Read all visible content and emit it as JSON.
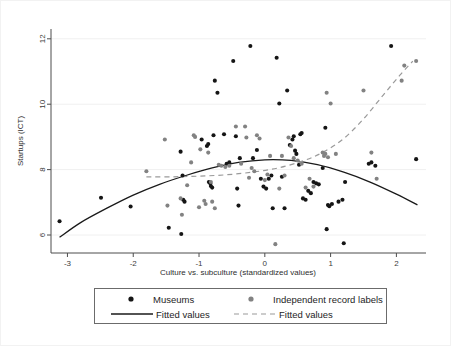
{
  "figure": {
    "background_color": "#ffffff",
    "plot_area": {
      "left": 50,
      "right": 425,
      "top": 28,
      "bottom": 252
    }
  },
  "chart_data": {
    "type": "scatter",
    "title": "",
    "xlabel": "Culture vs. subculture (standardized values)",
    "ylabel": "Startups (ICT)",
    "xlim": [
      -3.25,
      2.45
    ],
    "ylim": [
      5.45,
      12.3
    ],
    "xticks": [
      -3,
      -2,
      -1,
      0,
      1,
      2
    ],
    "xticklabels": [
      "-3",
      "-2",
      "-1",
      "0",
      "1",
      "2"
    ],
    "yticks": [
      6,
      8,
      10,
      12
    ],
    "yticklabels": [
      "6",
      "8",
      "10",
      "12"
    ],
    "grid": "horizontal-faint",
    "legend_position": "below-axes",
    "series": [
      {
        "name": "Museums",
        "marker": "circle",
        "color": "#151515",
        "size": 4.1,
        "points": [
          [
            -3.12,
            6.42
          ],
          [
            -2.49,
            7.14
          ],
          [
            -2.04,
            6.87
          ],
          [
            -1.46,
            6.22
          ],
          [
            -1.27,
            6.03
          ],
          [
            -1.25,
            7.82
          ],
          [
            -1.28,
            8.55
          ],
          [
            -1.24,
            7.08
          ],
          [
            -1.22,
            7.02
          ],
          [
            -0.96,
            8.92
          ],
          [
            -0.88,
            8.72
          ],
          [
            -0.86,
            8.78
          ],
          [
            -0.85,
            7.62
          ],
          [
            -0.83,
            7.58
          ],
          [
            -0.82,
            7.5
          ],
          [
            -0.8,
            7.45
          ],
          [
            -0.78,
            9.05
          ],
          [
            -0.72,
            10.35
          ],
          [
            -0.76,
            10.72
          ],
          [
            -0.62,
            9.08
          ],
          [
            -0.58,
            8.18
          ],
          [
            -0.54,
            8.22
          ],
          [
            -0.48,
            11.32
          ],
          [
            -0.44,
            9.02
          ],
          [
            -0.42,
            7.42
          ],
          [
            -0.4,
            6.9
          ],
          [
            -0.38,
            8.35
          ],
          [
            -0.22,
            11.78
          ],
          [
            -0.18,
            8.35
          ],
          [
            -0.12,
            8.6
          ],
          [
            -0.06,
            7.72
          ],
          [
            -0.02,
            7.48
          ],
          [
            0.02,
            7.42
          ],
          [
            0.06,
            7.72
          ],
          [
            0.1,
            7.82
          ],
          [
            0.12,
            6.82
          ],
          [
            0.18,
            11.42
          ],
          [
            0.22,
            10.02
          ],
          [
            0.26,
            7.78
          ],
          [
            0.3,
            6.82
          ],
          [
            0.34,
            10.42
          ],
          [
            0.38,
            8.75
          ],
          [
            0.42,
            8.92
          ],
          [
            0.44,
            9.02
          ],
          [
            0.46,
            8.58
          ],
          [
            0.48,
            8.48
          ],
          [
            0.52,
            8.15
          ],
          [
            0.54,
            9.08
          ],
          [
            0.56,
            9.12
          ],
          [
            0.58,
            7.12
          ],
          [
            0.62,
            7.08
          ],
          [
            0.66,
            7.35
          ],
          [
            0.7,
            7.28
          ],
          [
            0.74,
            7.62
          ],
          [
            0.78,
            7.58
          ],
          [
            0.82,
            7.55
          ],
          [
            0.88,
            8.05
          ],
          [
            0.92,
            9.28
          ],
          [
            0.94,
            6.18
          ],
          [
            0.96,
            6.92
          ],
          [
            0.98,
            6.88
          ],
          [
            1.02,
            6.95
          ],
          [
            1.12,
            7.02
          ],
          [
            1.18,
            7.08
          ],
          [
            1.2,
            5.75
          ],
          [
            1.22,
            7.62
          ],
          [
            1.58,
            8.18
          ],
          [
            1.62,
            8.22
          ],
          [
            1.68,
            8.12
          ],
          [
            1.92,
            11.78
          ],
          [
            2.3,
            8.32
          ]
        ]
      },
      {
        "name": "Independent record labels",
        "marker": "circle",
        "color": "#828282",
        "size": 4.1,
        "points": [
          [
            -1.8,
            7.95
          ],
          [
            -1.52,
            8.92
          ],
          [
            -1.48,
            6.9
          ],
          [
            -1.28,
            7.12
          ],
          [
            -1.26,
            6.62
          ],
          [
            -1.18,
            7.52
          ],
          [
            -1.12,
            8.22
          ],
          [
            -1.08,
            9.05
          ],
          [
            -1.06,
            9.0
          ],
          [
            -1.0,
            6.85
          ],
          [
            -0.98,
            8.62
          ],
          [
            -0.92,
            7.05
          ],
          [
            -0.9,
            6.95
          ],
          [
            -0.86,
            8.52
          ],
          [
            -0.82,
            7.62
          ],
          [
            -0.8,
            7.02
          ],
          [
            -0.76,
            6.82
          ],
          [
            -0.7,
            8.15
          ],
          [
            -0.66,
            8.12
          ],
          [
            -0.6,
            8.08
          ],
          [
            -0.54,
            8.12
          ],
          [
            -0.44,
            9.32
          ],
          [
            -0.36,
            8.18
          ],
          [
            -0.3,
            9.32
          ],
          [
            -0.28,
            8.98
          ],
          [
            -0.24,
            7.75
          ],
          [
            -0.2,
            8.05
          ],
          [
            -0.16,
            7.95
          ],
          [
            -0.12,
            9.05
          ],
          [
            -0.08,
            8.95
          ],
          [
            0.0,
            7.68
          ],
          [
            0.04,
            7.85
          ],
          [
            0.08,
            8.42
          ],
          [
            0.16,
            5.72
          ],
          [
            0.22,
            7.42
          ],
          [
            0.26,
            8.42
          ],
          [
            0.3,
            7.82
          ],
          [
            0.36,
            8.98
          ],
          [
            0.4,
            8.72
          ],
          [
            0.44,
            8.35
          ],
          [
            0.5,
            8.28
          ],
          [
            0.56,
            8.18
          ],
          [
            0.62,
            7.45
          ],
          [
            0.68,
            7.72
          ],
          [
            0.74,
            7.48
          ],
          [
            0.88,
            8.52
          ],
          [
            0.9,
            8.42
          ],
          [
            0.92,
            8.48
          ],
          [
            0.94,
            10.35
          ],
          [
            0.96,
            8.38
          ],
          [
            1.0,
            10.02
          ],
          [
            1.08,
            8.48
          ],
          [
            1.5,
            10.42
          ],
          [
            1.62,
            8.52
          ],
          [
            1.7,
            7.72
          ],
          [
            2.08,
            10.72
          ],
          [
            2.12,
            11.18
          ],
          [
            2.3,
            11.32
          ]
        ]
      }
    ],
    "fits": [
      {
        "name": "Fitted values",
        "for": "Museums",
        "style": "solid",
        "color": "#1a1a1a",
        "shape": "concave-quadratic",
        "points": [
          [
            -3.12,
            5.93
          ],
          [
            -2.8,
            6.38
          ],
          [
            -2.4,
            6.82
          ],
          [
            -2.0,
            7.22
          ],
          [
            -1.6,
            7.55
          ],
          [
            -1.2,
            7.82
          ],
          [
            -0.8,
            8.05
          ],
          [
            -0.4,
            8.22
          ],
          [
            0.0,
            8.3
          ],
          [
            0.4,
            8.28
          ],
          [
            0.8,
            8.15
          ],
          [
            1.2,
            7.92
          ],
          [
            1.6,
            7.62
          ],
          [
            2.0,
            7.25
          ],
          [
            2.32,
            6.92
          ]
        ]
      },
      {
        "name": "Fitted values",
        "for": "Independent record labels",
        "style": "dashed",
        "color": "#9a9a9a",
        "shape": "convex-rising",
        "points": [
          [
            -1.8,
            7.78
          ],
          [
            -1.4,
            7.78
          ],
          [
            -1.0,
            7.8
          ],
          [
            -0.6,
            7.84
          ],
          [
            -0.2,
            7.92
          ],
          [
            0.2,
            8.05
          ],
          [
            0.6,
            8.28
          ],
          [
            0.9,
            8.55
          ],
          [
            1.2,
            8.95
          ],
          [
            1.5,
            9.55
          ],
          [
            1.8,
            10.28
          ],
          [
            2.05,
            10.88
          ],
          [
            2.25,
            11.32
          ]
        ]
      }
    ]
  },
  "legend": {
    "entries": [
      {
        "label": "Museums",
        "symbol": "dot",
        "color": "#151515"
      },
      {
        "label": "Independent record labels",
        "symbol": "dot",
        "color": "#828282"
      },
      {
        "label": "Fitted values",
        "symbol": "solid-line",
        "color": "#1a1a1a"
      },
      {
        "label": "Fitted values",
        "symbol": "dashed-line",
        "color": "#9a9a9a"
      }
    ]
  }
}
